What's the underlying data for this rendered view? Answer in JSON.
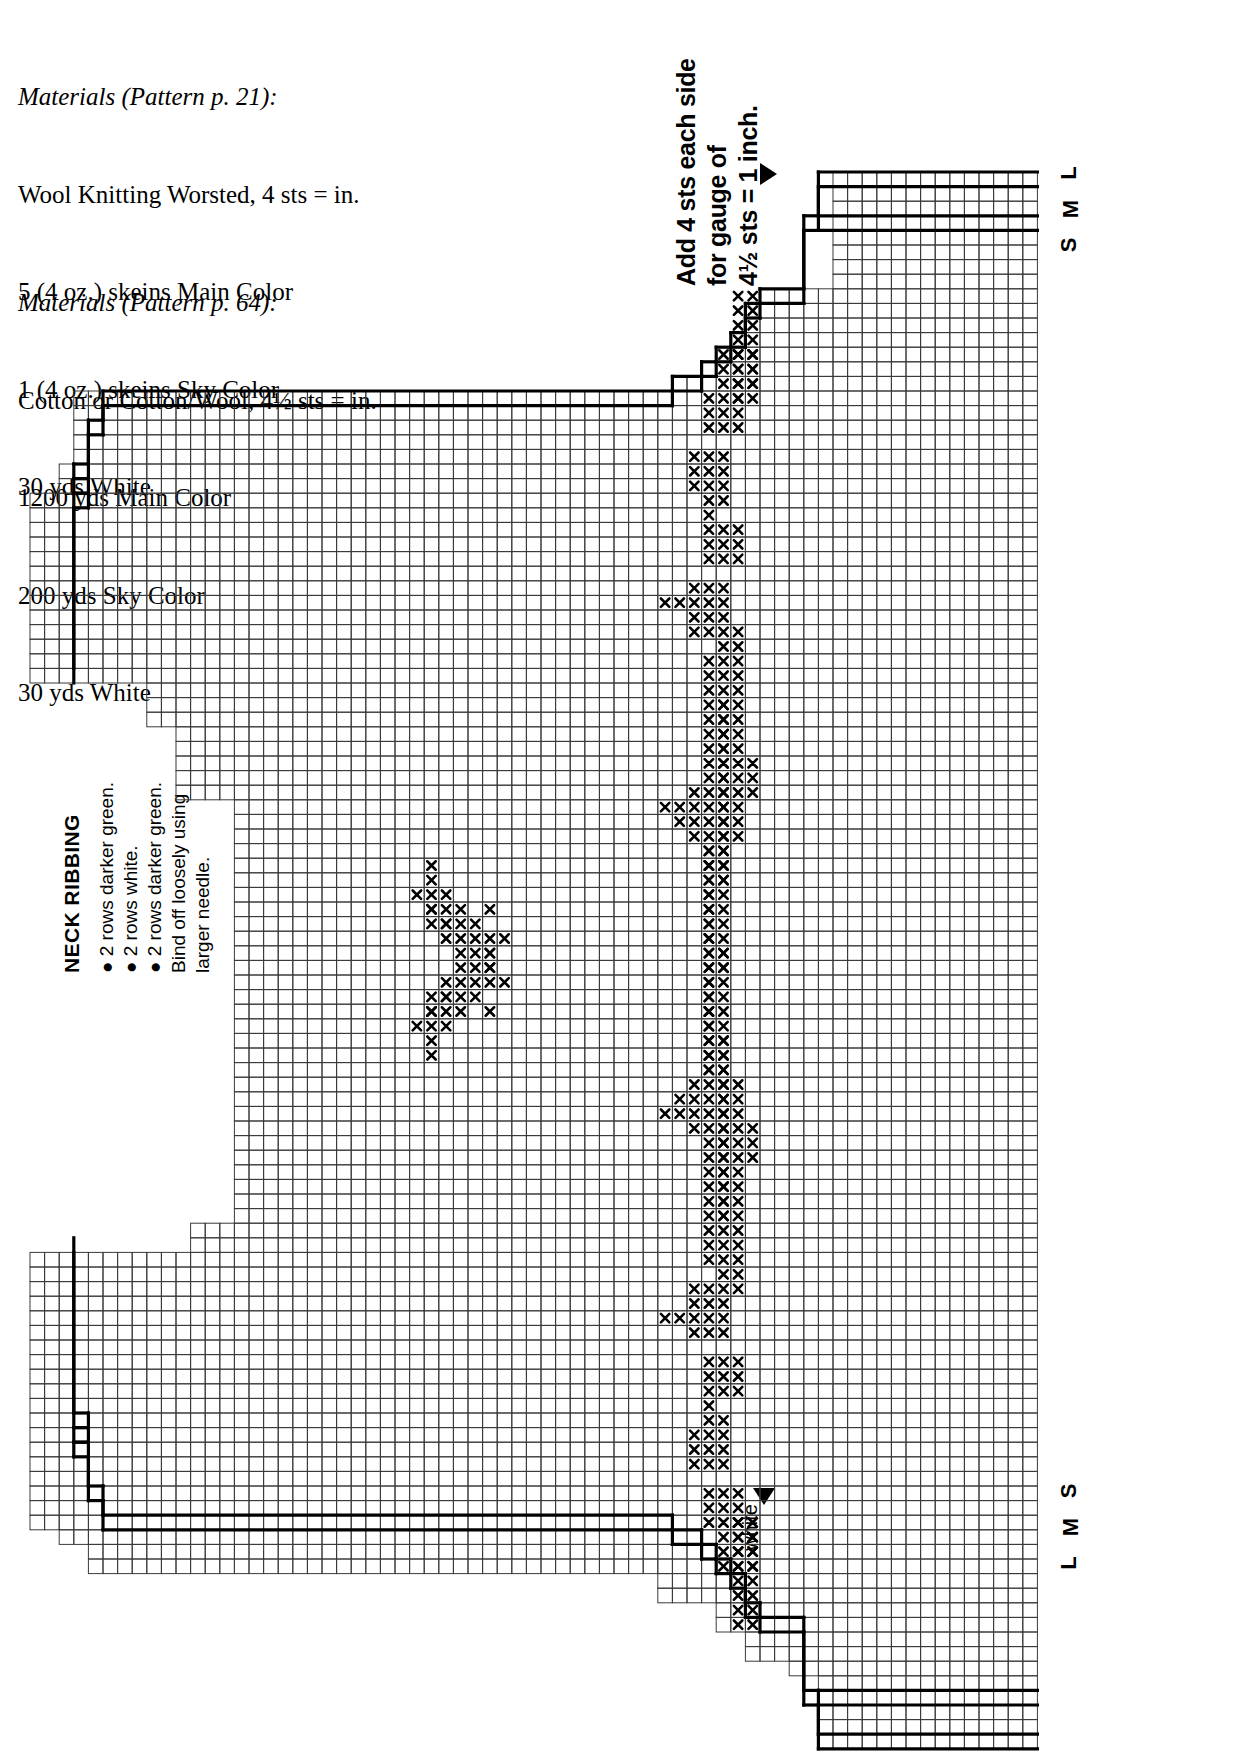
{
  "page": {
    "background": "#ffffff",
    "ink": "#000000"
  },
  "materials_a": {
    "heading": "Materials (Pattern p. 21):",
    "lines": [
      "Wool Knitting Worsted, 4 sts = in.",
      "5 (4 oz.) skeins Main Color",
      "1 (4 oz.) skeins Sky Color",
      "30 yds White"
    ]
  },
  "materials_b": {
    "heading": "Materials (Pattern p. 64):",
    "lines": [
      "Cotton or Cotton/Wool, 4½ sts = in.",
      "1200 yds Main Color",
      "200 yds Sky Color",
      "30 yds White"
    ]
  },
  "gauge_note": {
    "lines": [
      "Add 4 sts each side",
      "for gauge of",
      "4½ sts = 1 inch."
    ],
    "marker": "right-pointing-triangle"
  },
  "neck_ribbing": {
    "title": "NECK RIBBING",
    "lines": [
      "● 2 rows darker green.",
      "● 2 rows white.",
      "● 2 rows darker green.",
      "Bind off loosely using",
      "larger needle."
    ]
  },
  "white_marker": {
    "label": "white",
    "marker": "down-pointing-triangle"
  },
  "size_labels_top": [
    "L",
    "M",
    "S"
  ],
  "size_labels_bottom": [
    "S",
    "M",
    "L"
  ],
  "chart_data": {
    "type": "grid-chart",
    "cell": 14.6,
    "origin": {
      "x": 30.0,
      "y": 172.0
    },
    "cols": 69,
    "rows": 108,
    "grid": true,
    "grid_color": "#3a3a3a",
    "symbol": "x",
    "symbol_meaning": "White contrast stitch",
    "outline_color": "#000000",
    "outline_width": 3.2,
    "body_outline": [
      [
        [
          54,
          0
        ],
        [
          69,
          0
        ]
      ],
      [
        [
          54,
          0
        ],
        [
          54,
          3
        ]
      ],
      [
        [
          54,
          3
        ],
        [
          69,
          3
        ]
      ],
      [
        [
          53,
          3
        ],
        [
          54,
          3
        ]
      ],
      [
        [
          53,
          3
        ],
        [
          53,
          8
        ]
      ],
      [
        [
          50,
          8
        ],
        [
          53,
          8
        ]
      ],
      [
        [
          50,
          8
        ],
        [
          50,
          9
        ]
      ],
      [
        [
          49,
          9
        ],
        [
          50,
          9
        ]
      ],
      [
        [
          49,
          9
        ],
        [
          49,
          11
        ]
      ],
      [
        [
          48,
          11
        ],
        [
          49,
          11
        ]
      ],
      [
        [
          48,
          11
        ],
        [
          48,
          12
        ]
      ],
      [
        [
          47,
          12
        ],
        [
          48,
          12
        ]
      ],
      [
        [
          47,
          12
        ],
        [
          47,
          13
        ]
      ],
      [
        [
          46,
          13
        ],
        [
          47,
          13
        ]
      ],
      [
        [
          46,
          13
        ],
        [
          46,
          14
        ]
      ],
      [
        [
          44,
          14
        ],
        [
          46,
          14
        ]
      ],
      [
        [
          44,
          14
        ],
        [
          44,
          15
        ]
      ],
      [
        [
          5,
          15
        ],
        [
          44,
          15
        ]
      ],
      [
        [
          5,
          15
        ],
        [
          5,
          17
        ]
      ],
      [
        [
          4,
          17
        ],
        [
          5,
          17
        ]
      ],
      [
        [
          4,
          17
        ],
        [
          4,
          20
        ]
      ],
      [
        [
          3,
          20
        ],
        [
          4,
          20
        ]
      ],
      [
        [
          3,
          20
        ],
        [
          3,
          21
        ]
      ],
      [
        [
          4,
          21
        ],
        [
          3,
          21
        ]
      ],
      [
        [
          4,
          21
        ],
        [
          4,
          22
        ]
      ],
      [
        [
          3,
          22
        ],
        [
          4,
          22
        ]
      ],
      [
        [
          3,
          22
        ],
        [
          3,
          34
        ]
      ]
    ],
    "rows_extent": [
      {
        "row": 0,
        "from": 55,
        "to": 69
      },
      {
        "row": 1,
        "from": 55,
        "to": 69
      },
      {
        "row": 2,
        "from": 55,
        "to": 69
      },
      {
        "row": 3,
        "from": 55,
        "to": 69
      },
      {
        "row": 4,
        "from": 55,
        "to": 69
      },
      {
        "row": 5,
        "from": 55,
        "to": 69
      },
      {
        "row": 6,
        "from": 55,
        "to": 69
      },
      {
        "row": 7,
        "from": 55,
        "to": 69
      },
      {
        "row": 8,
        "from": 50,
        "to": 69
      },
      {
        "row": 9,
        "from": 49,
        "to": 69
      },
      {
        "row": 10,
        "from": 49,
        "to": 69
      },
      {
        "row": 11,
        "from": 48,
        "to": 69
      },
      {
        "row": 12,
        "from": 47,
        "to": 69
      },
      {
        "row": 13,
        "from": 46,
        "to": 69
      },
      {
        "row": 14,
        "from": 44,
        "to": 69
      },
      {
        "row": 15,
        "from": 3,
        "to": 69
      },
      {
        "row": 20,
        "from": 2,
        "to": 69
      },
      {
        "row": 22,
        "from": 0,
        "to": 69
      },
      {
        "row": 34,
        "from": 0,
        "to": 69
      },
      {
        "row": 35,
        "from": 8,
        "to": 69
      },
      {
        "row": 38,
        "from": 10,
        "to": 69
      },
      {
        "row": 43,
        "from": 14,
        "to": 69
      },
      {
        "row": 56,
        "from": 14,
        "to": 69
      },
      {
        "row": 72,
        "from": 11,
        "to": 69
      },
      {
        "row": 74,
        "from": 0,
        "to": 69
      },
      {
        "row": 92,
        "from": 0,
        "to": 69
      },
      {
        "row": 93,
        "from": 2,
        "to": 69
      },
      {
        "row": 94,
        "from": 4,
        "to": 69
      },
      {
        "row": 96,
        "from": 43,
        "to": 69
      },
      {
        "row": 98,
        "from": 47,
        "to": 69
      },
      {
        "row": 100,
        "from": 49,
        "to": 69
      },
      {
        "row": 102,
        "from": 52,
        "to": 69
      },
      {
        "row": 103,
        "from": 54,
        "to": 69
      },
      {
        "row": 108,
        "from": 54,
        "to": 69
      }
    ],
    "stitches": [
      [
        48,
        8
      ],
      [
        49,
        8
      ],
      [
        48,
        9
      ],
      [
        49,
        9
      ],
      [
        48,
        10
      ],
      [
        49,
        10
      ],
      [
        48,
        11
      ],
      [
        49,
        11
      ],
      [
        47,
        12
      ],
      [
        48,
        12
      ],
      [
        49,
        12
      ],
      [
        47,
        13
      ],
      [
        48,
        13
      ],
      [
        49,
        13
      ],
      [
        47,
        14
      ],
      [
        48,
        14
      ],
      [
        49,
        14
      ],
      [
        46,
        15
      ],
      [
        47,
        15
      ],
      [
        48,
        15
      ],
      [
        46,
        16
      ],
      [
        47,
        16
      ],
      [
        48,
        16
      ],
      [
        46,
        17
      ],
      [
        47,
        17
      ],
      [
        48,
        17
      ],
      [
        45,
        19
      ],
      [
        46,
        19
      ],
      [
        47,
        19
      ],
      [
        45,
        20
      ],
      [
        46,
        20
      ],
      [
        47,
        20
      ],
      [
        45,
        21
      ],
      [
        46,
        21
      ],
      [
        47,
        21
      ],
      [
        46,
        22
      ],
      [
        47,
        22
      ],
      [
        46,
        23
      ],
      [
        46,
        24
      ],
      [
        47,
        24
      ],
      [
        48,
        24
      ],
      [
        46,
        25
      ],
      [
        47,
        25
      ],
      [
        48,
        25
      ],
      [
        46,
        26
      ],
      [
        47,
        26
      ],
      [
        48,
        26
      ],
      [
        45,
        28
      ],
      [
        46,
        28
      ],
      [
        47,
        28
      ],
      [
        43,
        29
      ],
      [
        44,
        29
      ],
      [
        45,
        29
      ],
      [
        46,
        29
      ],
      [
        47,
        29
      ],
      [
        45,
        30
      ],
      [
        46,
        30
      ],
      [
        47,
        30
      ],
      [
        45,
        31
      ],
      [
        46,
        31
      ],
      [
        46,
        33
      ],
      [
        46,
        34
      ],
      [
        46,
        35
      ],
      [
        46,
        36
      ],
      [
        47,
        36
      ],
      [
        46,
        37
      ],
      [
        47,
        37
      ],
      [
        46,
        38
      ],
      [
        47,
        38
      ],
      [
        46,
        39
      ],
      [
        47,
        39
      ],
      [
        46,
        40
      ],
      [
        47,
        40
      ],
      [
        46,
        41
      ],
      [
        47,
        41
      ],
      [
        45,
        42
      ],
      [
        46,
        42
      ],
      [
        47,
        42
      ],
      [
        43,
        43
      ],
      [
        44,
        43
      ],
      [
        45,
        43
      ],
      [
        46,
        43
      ],
      [
        47,
        43
      ],
      [
        44,
        44
      ],
      [
        45,
        44
      ],
      [
        46,
        44
      ],
      [
        47,
        44
      ],
      [
        45,
        45
      ],
      [
        46,
        45
      ],
      [
        47,
        45
      ],
      [
        46,
        46
      ],
      [
        47,
        46
      ],
      [
        46,
        47
      ],
      [
        47,
        47
      ],
      [
        46,
        48
      ],
      [
        47,
        48
      ],
      [
        26,
        49
      ],
      [
        46,
        49
      ],
      [
        47,
        49
      ],
      [
        27,
        50
      ],
      [
        46,
        50
      ],
      [
        47,
        50
      ],
      [
        27,
        51
      ],
      [
        28,
        51
      ],
      [
        46,
        51
      ],
      [
        47,
        51
      ],
      [
        28,
        52
      ],
      [
        46,
        52
      ],
      [
        47,
        52
      ],
      [
        29,
        53
      ],
      [
        31,
        53
      ],
      [
        46,
        53
      ],
      [
        47,
        53
      ],
      [
        30,
        54
      ],
      [
        31,
        54
      ],
      [
        46,
        54
      ],
      [
        47,
        54
      ],
      [
        29,
        55
      ],
      [
        30,
        55
      ],
      [
        31,
        55
      ],
      [
        32,
        55
      ],
      [
        46,
        55
      ],
      [
        28,
        56
      ],
      [
        29,
        56
      ],
      [
        30,
        56
      ],
      [
        46,
        56
      ],
      [
        27,
        57
      ],
      [
        28,
        57
      ],
      [
        29,
        57
      ],
      [
        31,
        57
      ],
      [
        46,
        57
      ],
      [
        27,
        58
      ],
      [
        28,
        58
      ],
      [
        46,
        58
      ],
      [
        27,
        59
      ],
      [
        46,
        59
      ],
      [
        47,
        59
      ],
      [
        27,
        60
      ],
      [
        46,
        60
      ],
      [
        47,
        60
      ],
      [
        46,
        61
      ],
      [
        47,
        61
      ],
      [
        47,
        62
      ],
      [
        48,
        62
      ],
      [
        47,
        63
      ],
      [
        48,
        63
      ],
      [
        47,
        64
      ],
      [
        48,
        64
      ],
      [
        47,
        65
      ],
      [
        48,
        65
      ],
      [
        49,
        65
      ],
      [
        47,
        66
      ],
      [
        48,
        66
      ],
      [
        49,
        66
      ],
      [
        47,
        67
      ],
      [
        48,
        67
      ],
      [
        49,
        67
      ],
      [
        47,
        68
      ],
      [
        48,
        68
      ],
      [
        47,
        69
      ],
      [
        48,
        69
      ],
      [
        47,
        70
      ],
      [
        48,
        70
      ],
      [
        47,
        71
      ],
      [
        48,
        71
      ],
      [
        47,
        72
      ],
      [
        48,
        72
      ],
      [
        47,
        73
      ],
      [
        48,
        73
      ],
      [
        47,
        74
      ],
      [
        48,
        74
      ],
      [
        47,
        75
      ],
      [
        48,
        75
      ],
      [
        47,
        76
      ],
      [
        48,
        76
      ],
      [
        48,
        92
      ],
      [
        49,
        92
      ],
      [
        48,
        93
      ],
      [
        49,
        93
      ],
      [
        48,
        94
      ],
      [
        49,
        94
      ],
      [
        48,
        95
      ],
      [
        49,
        95
      ]
    ]
  }
}
